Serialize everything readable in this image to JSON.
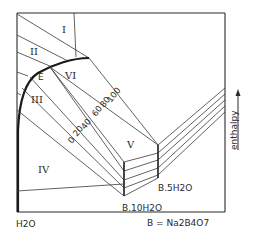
{
  "diagram": {
    "regions": [
      {
        "id": "I",
        "label": "I"
      },
      {
        "id": "II",
        "label": "II"
      },
      {
        "id": "III",
        "label": "III"
      },
      {
        "id": "IV",
        "label": "IV"
      },
      {
        "id": "V",
        "label": "V"
      },
      {
        "id": "VI",
        "label": "VI"
      },
      {
        "id": "E",
        "label": "E"
      }
    ],
    "isotherms": [
      {
        "label": "0"
      },
      {
        "label": "20"
      },
      {
        "label": "40"
      },
      {
        "label": "60"
      },
      {
        "label": "80"
      },
      {
        "label": "100"
      }
    ],
    "hydrates": {
      "decahydrate": "B.10H2O",
      "pentahydrate": "B.5H2O"
    },
    "axis": {
      "x_left_label": "H2O",
      "x_right_label": "B = Na2B4O7",
      "y_label": "enthalpy"
    }
  }
}
